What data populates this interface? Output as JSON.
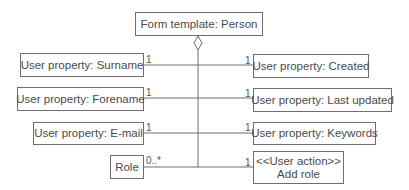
{
  "diagram": {
    "root": {
      "label": "Form template: Person"
    },
    "left": [
      {
        "label": "User property: Surname",
        "multiplicity": "1"
      },
      {
        "label": "User property: Forename",
        "multiplicity": "1"
      },
      {
        "label": "User property: E-mail",
        "multiplicity": "1"
      },
      {
        "label": "Role",
        "multiplicity": "0..*"
      }
    ],
    "right": [
      {
        "label": "User property: Created",
        "multiplicity": "1"
      },
      {
        "label": "User property: Last updated",
        "multiplicity": "1"
      },
      {
        "label": "User property: Keywords",
        "multiplicity": "1"
      },
      {
        "stereotype": "<<User action>>",
        "label": "Add role",
        "multiplicity": "1"
      }
    ],
    "connector": "aggregation-diamond"
  }
}
